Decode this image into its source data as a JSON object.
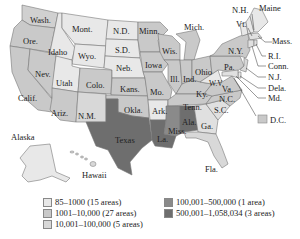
{
  "map": {
    "colors": {
      "c1": "#e8e8e8",
      "c2": "#c9c9c9",
      "c3": "#d8d8d8",
      "c4": "#8a8a8a",
      "c5": "#6e6e6e"
    },
    "state_labels": {
      "wash": "Wash.",
      "ore": "Ore.",
      "calif": "Calif.",
      "idaho": "Idaho",
      "nev": "Nev.",
      "mont": "Mont.",
      "wyo": "Wyo.",
      "utah": "Utah",
      "ariz": "Ariz.",
      "colo": "Colo.",
      "nm": "N.M.",
      "nd": "N.D.",
      "sd": "S.D.",
      "neb": "Neb.",
      "kans": "Kans.",
      "okla": "Okla.",
      "texas": "Texas",
      "minn": "Minn.",
      "iowa": "Iowa",
      "mo": "Mo.",
      "ark": "Ark.",
      "la": "La.",
      "wis": "Wis.",
      "ill": "Ill.",
      "mich": "Mich.",
      "ind": "Ind.",
      "ohio": "Ohio",
      "ky": "Ky.",
      "tenn": "Tenn.",
      "miss": "Miss.",
      "ala": "Ala.",
      "ga": "Ga.",
      "fla": "Fla.",
      "sc": "S.C.",
      "nc": "N.C.",
      "va": "Va.",
      "wv": "W.V.",
      "pa": "Pa.",
      "ny": "N.Y.",
      "vt": "Vt.",
      "nh": "N.H.",
      "maine": "Maine",
      "mass": "Mass.",
      "ri": "R.I.",
      "conn": "Conn.",
      "nj": "N.J.",
      "dela": "Dela.",
      "md": "Md.",
      "dc": "D.C.",
      "alaska": "Alaska",
      "hawaii": "Hawaii"
    },
    "legend": [
      {
        "label": "85–1000 (15 areas)",
        "class": "c1"
      },
      {
        "label": "1001–10,000 (27 areas)",
        "class": "c2"
      },
      {
        "label": "10,001–100,000 (5 areas)",
        "class": "c3"
      },
      {
        "label": "100,001–500,000 (1 area)",
        "class": "c4"
      },
      {
        "label": "500,001–1,058,034 (3 areas)",
        "class": "c5"
      }
    ]
  }
}
